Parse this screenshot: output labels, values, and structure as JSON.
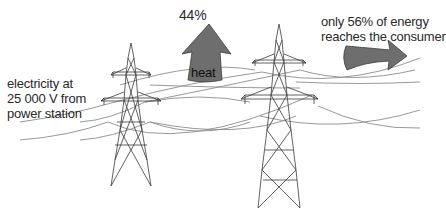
{
  "diagram": {
    "labels": {
      "source_line1": "electricity at",
      "source_line2": "25 000 V from",
      "source_line3": "power station",
      "heat_percent": "44%",
      "heat_word": "heat",
      "consumer_line1": "only 56% of energy",
      "consumer_line2": "reaches the consumer"
    },
    "arrows": {
      "heat_loss": {
        "direction": "up",
        "percent": 44,
        "color": "#6e6e6e"
      },
      "delivered": {
        "direction": "right",
        "percent": 56,
        "color": "#6e6e6e"
      }
    },
    "pylons": [
      {
        "name": "left-pylon",
        "x": 130
      },
      {
        "name": "right-pylon",
        "x": 278
      }
    ],
    "colors": {
      "wire": "#8a8a8a",
      "pylon": "#3a3a3a",
      "arrow_fill": "#6e6e6e",
      "arrow_stroke": "#3c3c3c"
    }
  }
}
